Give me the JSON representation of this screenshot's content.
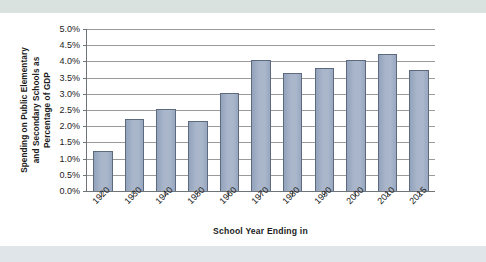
{
  "chart_data": {
    "type": "bar",
    "title": "",
    "subtitle": "",
    "xlabel": "School Year Ending in",
    "ylabel": "Spending on Public Elementary and Secondary Schools as Percentage of GDP",
    "categories": [
      "1920",
      "1930",
      "1940",
      "1950",
      "1960",
      "1970",
      "1980",
      "1990",
      "2000",
      "2010",
      "2015"
    ],
    "values": [
      1.22,
      2.23,
      2.52,
      2.17,
      3.02,
      4.05,
      3.64,
      3.81,
      4.04,
      4.23,
      3.72
    ],
    "value_labels": [
      "1.2%",
      "2.2%",
      "2.5%",
      "2.2%",
      "3.0%",
      "4.1%",
      "3.6%",
      "3.8%",
      "4.0%",
      "4.2%",
      "3.7%"
    ],
    "ylim": [
      0.0,
      5.0
    ],
    "ytick_values": [
      0.0,
      0.5,
      1.0,
      1.5,
      2.0,
      2.5,
      3.0,
      3.5,
      4.0,
      4.5,
      5.0
    ],
    "ytick_labels": [
      "0.0%",
      "0.5%",
      "1.0%",
      "1.5%",
      "2.0%",
      "2.5%",
      "3.0%",
      "3.5%",
      "4.0%",
      "4.5%",
      "5.0%"
    ],
    "grid": true,
    "grid_axis": "y",
    "legend": false,
    "legend_position": "none",
    "bar_fill_color": "#9FADC4",
    "bar_border_color": "#5D6A7D",
    "gridline_color": "#9A9A9A",
    "axis_color": "#6F7478",
    "plot_background": "#FFFFFF",
    "page_background": "#FFFFFF",
    "scan_band_color_top": "#D9E2DE",
    "scan_band_color_bottom": "#DFE5E8",
    "xlabel_rotation_degrees": -45
  },
  "axis": {
    "y_title_line1": "Spending on Public Elementary",
    "y_title_line2": "and Secondary Schools as",
    "y_title_line3": "Percentage of GDP",
    "x_title": "School Year Ending in"
  }
}
